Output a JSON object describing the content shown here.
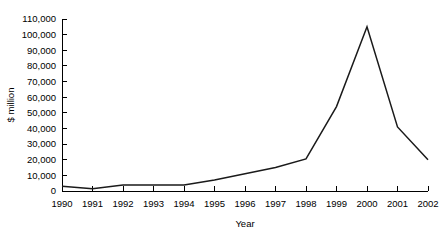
{
  "chart_data": {
    "type": "line",
    "title": "",
    "xlabel": "Year",
    "ylabel": "$ million",
    "categories": [
      "1990",
      "1991",
      "1992",
      "1993",
      "1994",
      "1995",
      "1996",
      "1997",
      "1998",
      "1999",
      "2000",
      "2001",
      "2002"
    ],
    "x": [
      1990,
      1991,
      1992,
      1993,
      1994,
      1995,
      1996,
      1997,
      1998,
      1999,
      2000,
      2001,
      2002
    ],
    "values": [
      3000,
      1500,
      3800,
      3800,
      3900,
      7000,
      11000,
      15000,
      20500,
      54000,
      105000,
      41000,
      20000
    ],
    "series": [
      {
        "name": "",
        "values": [
          3000,
          1500,
          3800,
          3800,
          3900,
          7000,
          11000,
          15000,
          20500,
          54000,
          105000,
          41000,
          20000
        ]
      }
    ],
    "ylim": [
      0,
      110000
    ],
    "xlim": [
      1990,
      2002
    ],
    "ytick_values": [
      0,
      10000,
      20000,
      30000,
      40000,
      50000,
      60000,
      70000,
      80000,
      90000,
      100000,
      110000
    ],
    "ytick_labels": [
      "0",
      "10,000",
      "20,000",
      "30,000",
      "40,000",
      "50,000",
      "60,000",
      "70,000",
      "80,000",
      "90,000",
      "100,000",
      "110,000"
    ],
    "grid": false,
    "legend": false,
    "legend_position": "none",
    "line_color": "#1a1a1a",
    "axis_color": "#000000",
    "background_color": "#ffffff"
  }
}
